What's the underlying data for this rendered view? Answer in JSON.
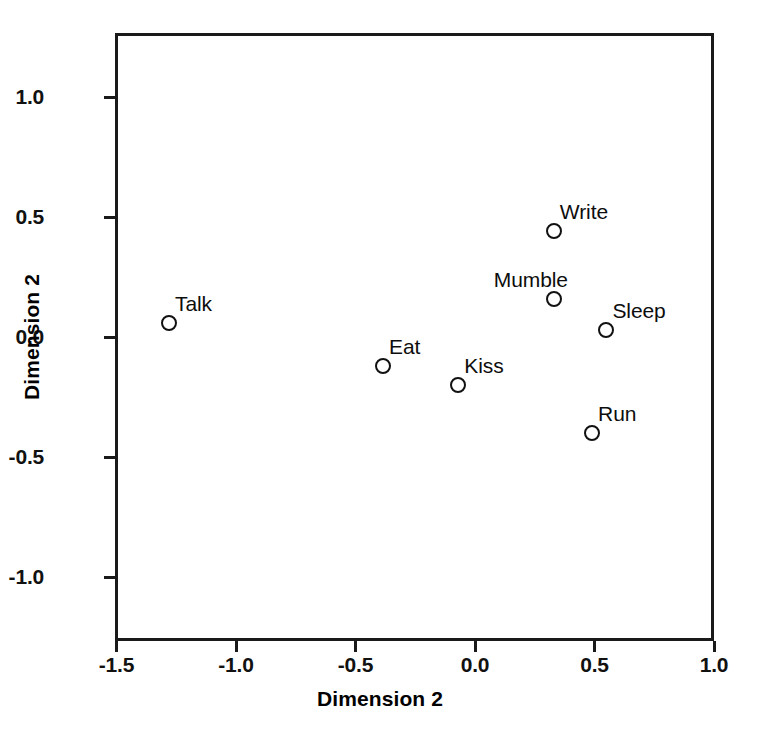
{
  "chart_data": {
    "type": "scatter",
    "title": "",
    "xlabel": "Dimension 2",
    "ylabel": "Dimension 2",
    "xlim": [
      -1.5,
      1.0
    ],
    "ylim": [
      -1.27,
      1.27
    ],
    "xticks": [
      "-1.5",
      "-1.0",
      "-0.5",
      "0.0",
      "0.5",
      "1.0"
    ],
    "xtick_values": [
      -1.5,
      -1.0,
      -0.5,
      0.0,
      0.5,
      1.0
    ],
    "yticks": [
      "-1.0",
      "-0.5",
      "0.0",
      "0.5",
      "1.0"
    ],
    "ytick_values": [
      -1.0,
      -0.5,
      0.0,
      0.5,
      1.0
    ],
    "grid": false,
    "legend": false,
    "marker_style": "open-circle",
    "points": [
      {
        "label": "Talk",
        "x": -1.28,
        "y": 0.06,
        "label_anchor": "right"
      },
      {
        "label": "Eat",
        "x": -0.385,
        "y": -0.12,
        "label_anchor": "right"
      },
      {
        "label": "Kiss",
        "x": -0.07,
        "y": -0.2,
        "label_anchor": "right"
      },
      {
        "label": "Write",
        "x": 0.33,
        "y": 0.44,
        "label_anchor": "right"
      },
      {
        "label": "Mumble",
        "x": 0.33,
        "y": 0.16,
        "label_anchor": "left"
      },
      {
        "label": "Sleep",
        "x": 0.55,
        "y": 0.03,
        "label_anchor": "right"
      },
      {
        "label": "Run",
        "x": 0.49,
        "y": -0.4,
        "label_anchor": "right"
      }
    ]
  },
  "colors": {
    "axis": "#1a1a1a",
    "marker": "#111111",
    "text": "#000000",
    "background": "#ffffff"
  }
}
